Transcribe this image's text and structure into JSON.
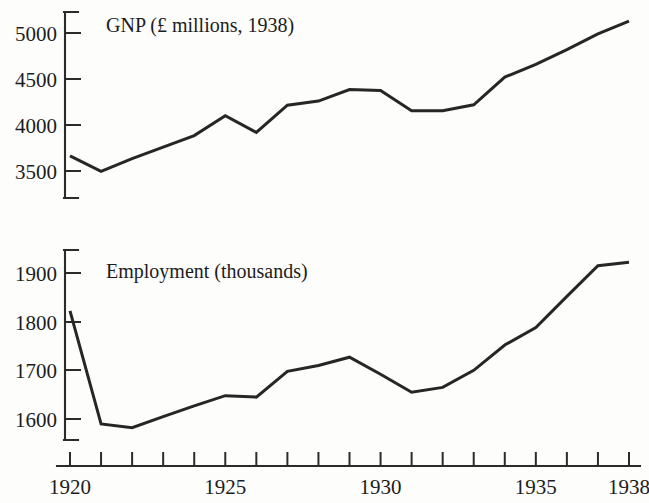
{
  "chart_data": [
    {
      "type": "line",
      "title": "GNP (£ millions, 1938)",
      "panel": "upper",
      "xlabel": "",
      "ylabel": "",
      "grid": false,
      "legend": "none",
      "xlim": [
        1920,
        1938
      ],
      "ylim": [
        3380,
        5180
      ],
      "ytick_labels": [
        "5000",
        "4500",
        "4000",
        "3500"
      ],
      "ytick_values": [
        5000,
        4500,
        4000,
        3500
      ],
      "x": [
        1920,
        1921,
        1922,
        1923,
        1924,
        1925,
        1926,
        1927,
        1928,
        1929,
        1930,
        1931,
        1932,
        1933,
        1934,
        1935,
        1936,
        1937,
        1938
      ],
      "values": [
        3665,
        3495,
        3635,
        3760,
        3885,
        4100,
        3920,
        4215,
        4260,
        4385,
        4375,
        4155,
        4155,
        4220,
        4520,
        4660,
        4820,
        4990,
        5130
      ]
    },
    {
      "type": "line",
      "title": "Employment (thousands)",
      "panel": "lower",
      "xlabel": "",
      "ylabel": "",
      "grid": false,
      "legend": "none",
      "xlim": [
        1920,
        1938
      ],
      "ylim": [
        1560,
        1940
      ],
      "ytick_labels": [
        "1900",
        "1800",
        "1700",
        "1600"
      ],
      "ytick_values": [
        1900,
        1800,
        1700,
        1600
      ],
      "x": [
        1920,
        1921,
        1922,
        1923,
        1924,
        1925,
        1926,
        1927,
        1928,
        1929,
        1930,
        1931,
        1932,
        1933,
        1934,
        1935,
        1936,
        1937,
        1938
      ],
      "values": [
        1822,
        1590,
        1582,
        1605,
        1627,
        1648,
        1645,
        1698,
        1710,
        1727,
        1692,
        1655,
        1665,
        1700,
        1752,
        1788,
        1852,
        1915,
        1922
      ]
    }
  ],
  "axis": {
    "x_tick_years": [
      1920,
      1921,
      1922,
      1923,
      1924,
      1925,
      1926,
      1927,
      1928,
      1929,
      1930,
      1931,
      1932,
      1933,
      1934,
      1935,
      1936,
      1937,
      1938
    ],
    "x_labels": [
      {
        "year": 1920,
        "text": "1920"
      },
      {
        "year": 1925,
        "text": "1925"
      },
      {
        "year": 1930,
        "text": "1930"
      },
      {
        "year": 1935,
        "text": "1935"
      },
      {
        "year": 1938,
        "text": "1938"
      }
    ]
  },
  "titles": {
    "upper": "GNP (£ millions, 1938)",
    "lower": "Employment (thousands)"
  },
  "colors": {
    "ink": "#262626",
    "axis": "#2b2b2b",
    "background": "#fdfdfc"
  }
}
